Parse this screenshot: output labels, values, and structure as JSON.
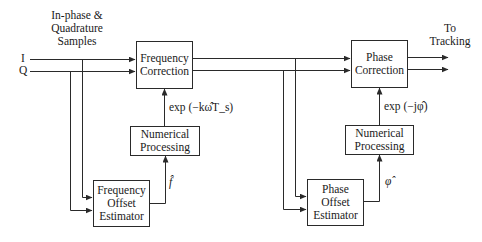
{
  "diagram": {
    "inputs": {
      "header_lines": [
        "In-phase &",
        "Quadrature",
        "Samples"
      ],
      "i_label": "I",
      "q_label": "Q"
    },
    "output": {
      "label_lines": [
        "To",
        "Tracking"
      ]
    },
    "blocks": {
      "frequency_correction": [
        "Frequency",
        "Correction"
      ],
      "numerical_processing_1": [
        "Numerical",
        "Processing"
      ],
      "frequency_offset_estimator": [
        "Frequency",
        "Offset",
        "Estimator"
      ],
      "phase_correction": [
        "Phase",
        "Correction"
      ],
      "numerical_processing_2": [
        "Numerical",
        "Processing"
      ],
      "phase_offset_estimator": [
        "Phase",
        "Offset",
        "Estimator"
      ]
    },
    "signals": {
      "freq_correction_input": "exp (−kω̂T_s)",
      "freq_estimate": "f̂",
      "phase_correction_input": "exp (−jφ̂)",
      "phase_estimate": "φ̂"
    },
    "colors": {
      "line": "#2a2a2a",
      "background": "#ffffff"
    }
  }
}
